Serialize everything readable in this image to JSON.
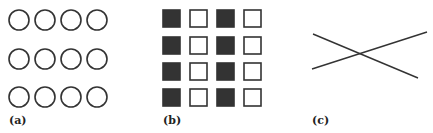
{
  "panels": [
    {
      "id": "a",
      "label": "(a)",
      "description": "3 rows x 4 columns of open circles"
    },
    {
      "id": "b",
      "label": "(b)",
      "description": "4 rows x 4 columns of squares; columns alternate filled and open"
    },
    {
      "id": "c",
      "label": "(c)",
      "description": "two crossing line segments"
    }
  ],
  "colors": {
    "stroke": "#333333",
    "fill": "#333333",
    "background": "#ffffff"
  }
}
